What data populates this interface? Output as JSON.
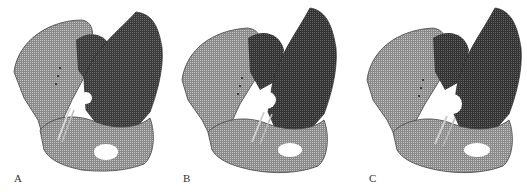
{
  "figure": {
    "colors": {
      "background": "#ffffff",
      "mesh_dark": "#2a2a2a",
      "mesh_mid": "#6a6a6a",
      "mesh_light": "#b5b5b5",
      "label": "#333333"
    },
    "panels": [
      {
        "label": "A",
        "subject": "pelvis-mesh-model",
        "left": 0,
        "label_x": 14,
        "label_y": 173
      },
      {
        "label": "B",
        "subject": "pelvis-mesh-model",
        "left": 172,
        "label_x": 11,
        "label_y": 173
      },
      {
        "label": "C",
        "subject": "pelvis-mesh-model",
        "left": 349,
        "label_x": 20,
        "label_y": 173
      }
    ]
  }
}
